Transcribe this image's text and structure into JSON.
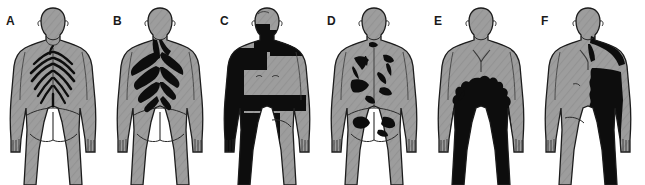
{
  "figure": {
    "background_color": "#ffffff",
    "skin_color": "#9d9d9d",
    "skin_shade_color": "#8e8e8e",
    "outline_color": "#1c1c1c",
    "lesion_color": "#0d0d0d",
    "panel_count": 6,
    "panel_width": 107,
    "panel_height": 185
  },
  "panels": [
    {
      "label": "A",
      "view": "posterior",
      "pattern": "bilateral-thin-dermatomal-bands",
      "lesion_description": "Narrow dark curvilinear bands radiating symmetrically from the spine across the upper and mid back"
    },
    {
      "label": "B",
      "view": "posterior",
      "pattern": "broad-bilateral-bands-upper-back",
      "lesion_description": "Thick confluent black bands over the upper and mid back extending from the nape and both scapulae"
    },
    {
      "label": "C",
      "view": "anterior",
      "pattern": "rectangular-blocks-left-hemibody",
      "lesion_description": "Solid rectangular black blocks over the left shoulder, left arm, a transverse waist band and the left hip and thigh"
    },
    {
      "label": "D",
      "view": "posterior",
      "pattern": "scattered-irregular-patches",
      "lesion_description": "Multiple discrete irregular black patches scattered over the back, flank and buttocks"
    },
    {
      "label": "E",
      "view": "anterior",
      "pattern": "confluent-lower-trunk-and-thighs",
      "lesion_description": "Large confluent black area covering the lower chest, abdomen, pelvis and both thighs with a ragged upper border"
    },
    {
      "label": "F",
      "view": "anterior",
      "pattern": "hemibody-right-side",
      "lesion_description": "Black area covering one entire half of the trunk and thigh with a scalloped midline border, extending to the shoulder and neck"
    }
  ]
}
